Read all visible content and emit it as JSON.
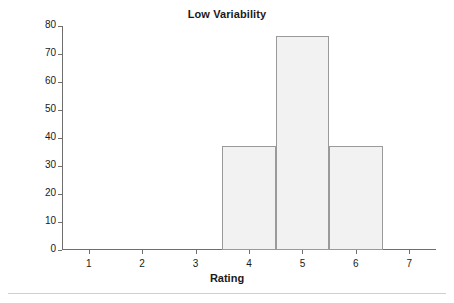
{
  "chart_data": {
    "type": "bar",
    "title": "Low Variability",
    "xlabel": "Rating",
    "ylabel": "Frequency",
    "categories": [
      "4",
      "5",
      "6"
    ],
    "values": [
      37,
      76.5,
      37
    ],
    "bins": [
      {
        "label": "4",
        "left": 3.5,
        "right": 4.5,
        "value": 37
      },
      {
        "label": "5",
        "left": 4.5,
        "right": 5.5,
        "value": 76.5
      },
      {
        "label": "6",
        "left": 5.5,
        "right": 6.5,
        "value": 37
      }
    ],
    "x": [
      1,
      2,
      3,
      4,
      5,
      6,
      7
    ],
    "xtick_labels": [
      "1",
      "2",
      "3",
      "4",
      "5",
      "6",
      "7"
    ],
    "xlim": [
      0.5,
      7.5
    ],
    "ytick_labels": [
      "0",
      "10",
      "20",
      "30",
      "40",
      "50",
      "60",
      "70",
      "80"
    ],
    "yticks": [
      0,
      10,
      20,
      30,
      40,
      50,
      60,
      70,
      80
    ],
    "ylim": [
      0,
      80
    ],
    "grid": false,
    "legend": false,
    "bar_fill_color": "#f2f2f2",
    "bar_edge_color": "#9a9a9a",
    "axis_color": "#6e6e6e",
    "text_color": "#1a1a1a",
    "background_color": "#ffffff"
  }
}
